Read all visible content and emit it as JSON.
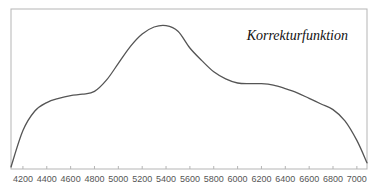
{
  "chart_data": {
    "type": "line",
    "title": "Korrekturfunktion",
    "xlabel": "",
    "ylabel": "",
    "xlim": [
      4100,
      7085
    ],
    "ylim": [
      0,
      1
    ],
    "grid": false,
    "legend": null,
    "x_ticks": [
      4200,
      4400,
      4600,
      4800,
      5000,
      5200,
      5400,
      5600,
      5800,
      6000,
      6200,
      6400,
      6600,
      6800,
      7000
    ],
    "series": [
      {
        "name": "Korrekturfunktion",
        "color": "#555555",
        "x": [
          4100,
          4200,
          4300,
          4400,
          4500,
          4600,
          4700,
          4800,
          4900,
          5000,
          5100,
          5200,
          5300,
          5400,
          5500,
          5600,
          5700,
          5800,
          5900,
          6000,
          6100,
          6200,
          6300,
          6400,
          6500,
          6600,
          6700,
          6800,
          6900,
          7000,
          7085
        ],
        "y": [
          0.0,
          0.26,
          0.4,
          0.46,
          0.49,
          0.51,
          0.52,
          0.54,
          0.62,
          0.74,
          0.86,
          0.95,
          1.0,
          1.01,
          0.97,
          0.85,
          0.76,
          0.68,
          0.63,
          0.6,
          0.595,
          0.595,
          0.585,
          0.56,
          0.53,
          0.49,
          0.45,
          0.41,
          0.33,
          0.19,
          0.03
        ]
      }
    ]
  },
  "annotation": {
    "label": "Korrekturfunktion"
  }
}
